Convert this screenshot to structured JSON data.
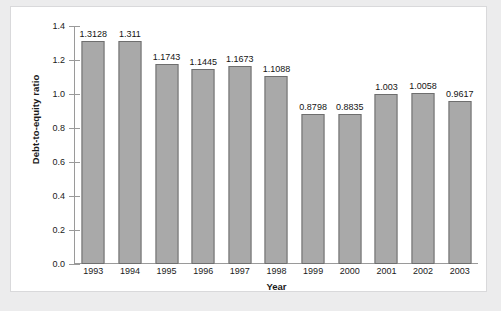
{
  "chart_data": {
    "type": "bar",
    "title": "",
    "xlabel": "Year",
    "ylabel": "Debt-to-equity ratio",
    "categories": [
      "1993",
      "1994",
      "1995",
      "1996",
      "1997",
      "1998",
      "1999",
      "2000",
      "2001",
      "2002",
      "2003"
    ],
    "values": [
      1.3128,
      1.311,
      1.1743,
      1.1445,
      1.1673,
      1.1088,
      0.8798,
      0.8835,
      1.003,
      1.0058,
      0.9617
    ],
    "point_labels": [
      "1.3128",
      "1.311",
      "1.1743",
      "1.1445",
      "1.1673",
      "1.1088",
      "0.8798",
      "0.8835",
      "1.003",
      "1.0058",
      "0.9617"
    ],
    "ylim": [
      0.0,
      1.4
    ],
    "ytick_values": [
      0.0,
      0.2,
      0.4,
      0.6,
      0.8,
      1.0,
      1.2,
      1.4
    ],
    "ytick_labels": [
      "0.0",
      "0.2",
      "0.4",
      "0.6",
      "0.8",
      "1.0",
      "1.2",
      "1.4"
    ],
    "grid": false,
    "legend": false,
    "series": [
      {
        "name": "Debt-to-equity ratio",
        "values": [
          1.3128,
          1.311,
          1.1743,
          1.1445,
          1.1673,
          1.1088,
          0.8798,
          0.8835,
          1.003,
          1.0058,
          0.9617
        ]
      }
    ],
    "colors": {
      "bar_fill": "#a9a9a9",
      "bar_border": "#6e6e6e",
      "axis": "#9a9a9a",
      "text": "#1a1a1a",
      "plot_background": "#ffffff",
      "page_background": "#ececed",
      "card_border": "#d9d9db"
    }
  }
}
